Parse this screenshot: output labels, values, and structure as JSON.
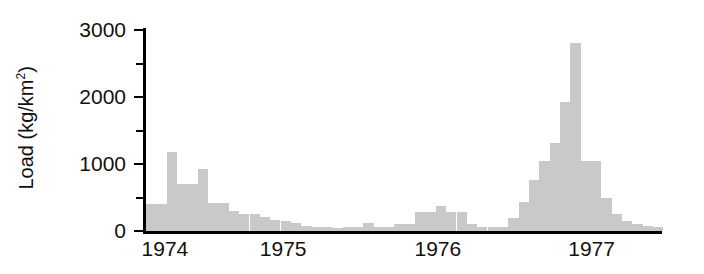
{
  "chart_data": {
    "type": "bar",
    "title": "",
    "subtitle": "",
    "xlabel": "",
    "ylabel": "Load (kg/km2)",
    "ylabel_plain": "Load  (kg/km",
    "ylabel_sup": "2",
    "ylabel_close": ")",
    "ylim": [
      0,
      3000
    ],
    "xlim_labels": [
      "1974",
      "1975",
      "1976",
      "1977"
    ],
    "ytick_labels": [
      "0",
      "1000",
      "2000",
      "3000"
    ],
    "ytick_values": [
      0,
      1000,
      2000,
      3000
    ],
    "yminor_values": [
      500,
      1500,
      2500
    ],
    "grid": false,
    "legend": false,
    "bar_color": "#c9c9c9",
    "axis_color": "#000000",
    "x": [
      "1974.00",
      "1974.04",
      "1974.08",
      "1974.12",
      "1974.17",
      "1974.21",
      "1974.25",
      "1974.29",
      "1974.33",
      "1974.38",
      "1974.42",
      "1974.46",
      "1974.50",
      "1974.54",
      "1974.58",
      "1974.62",
      "1974.67",
      "1974.71",
      "1974.75",
      "1974.79",
      "1974.83",
      "1974.88",
      "1974.92",
      "1974.96",
      "1975.00",
      "1975.04",
      "1975.08",
      "1975.12",
      "1975.17",
      "1975.21",
      "1975.25",
      "1975.29",
      "1975.33",
      "1975.38",
      "1975.42",
      "1975.46",
      "1975.50",
      "1975.54",
      "1975.58",
      "1975.62",
      "1975.67",
      "1975.71",
      "1975.75"
    ],
    "values": [
      400,
      400,
      1180,
      1180,
      700,
      700,
      930,
      930,
      420,
      420,
      300,
      250,
      250,
      215,
      190,
      160,
      150,
      120,
      75,
      70,
      60,
      55,
      50,
      55,
      60,
      120,
      120,
      300,
      300,
      370,
      370,
      300,
      300,
      90,
      60,
      60,
      80,
      200,
      430,
      760,
      1040,
      1310,
      1930
    ],
    "bars": [
      {
        "x": 0,
        "v": 400
      },
      {
        "x": 1,
        "v": 400
      },
      {
        "x": 2,
        "v": 1180
      },
      {
        "x": 3,
        "v": 700
      },
      {
        "x": 4,
        "v": 700
      },
      {
        "x": 5,
        "v": 930
      },
      {
        "x": 6,
        "v": 420
      },
      {
        "x": 7,
        "v": 420
      },
      {
        "x": 8,
        "v": 300
      },
      {
        "x": 9,
        "v": 250
      },
      {
        "x": 10,
        "v": 250
      },
      {
        "x": 11,
        "v": 215
      },
      {
        "x": 12,
        "v": 165
      },
      {
        "x": 13,
        "v": 150
      },
      {
        "x": 14,
        "v": 120
      },
      {
        "x": 15,
        "v": 75
      },
      {
        "x": 16,
        "v": 60
      },
      {
        "x": 17,
        "v": 55
      },
      {
        "x": 18,
        "v": 50
      },
      {
        "x": 19,
        "v": 55
      },
      {
        "x": 20,
        "v": 60
      },
      {
        "x": 21,
        "v": 120
      },
      {
        "x": 22,
        "v": 60
      },
      {
        "x": 23,
        "v": 55
      },
      {
        "x": 24,
        "v": 110
      },
      {
        "x": 25,
        "v": 110
      },
      {
        "x": 26,
        "v": 290
      },
      {
        "x": 27,
        "v": 290
      },
      {
        "x": 28,
        "v": 370
      },
      {
        "x": 29,
        "v": 290
      },
      {
        "x": 30,
        "v": 290
      },
      {
        "x": 31,
        "v": 100
      },
      {
        "x": 32,
        "v": 60
      },
      {
        "x": 33,
        "v": 55
      },
      {
        "x": 34,
        "v": 60
      },
      {
        "x": 35,
        "v": 200
      },
      {
        "x": 36,
        "v": 430
      },
      {
        "x": 37,
        "v": 760
      },
      {
        "x": 38,
        "v": 1040
      },
      {
        "x": 39,
        "v": 1310
      },
      {
        "x": 40,
        "v": 1930
      },
      {
        "x": 41,
        "v": 2800
      },
      {
        "x": 42,
        "v": 1040
      },
      {
        "x": 43,
        "v": 1040
      },
      {
        "x": 44,
        "v": 490
      },
      {
        "x": 45,
        "v": 250
      },
      {
        "x": 46,
        "v": 150
      },
      {
        "x": 47,
        "v": 110
      },
      {
        "x": 48,
        "v": 80
      },
      {
        "x": 49,
        "v": 60
      }
    ],
    "annotations": []
  },
  "axes": {
    "y_title_prefix": "Load  (kg/km",
    "y_title_superscript": "2",
    "y_title_suffix": ")",
    "y_ticks": [
      {
        "label": "3000",
        "value": 3000,
        "major": true
      },
      {
        "label": "",
        "value": 2500,
        "major": false
      },
      {
        "label": "2000",
        "value": 2000,
        "major": true
      },
      {
        "label": "",
        "value": 1500,
        "major": false
      },
      {
        "label": "1000",
        "value": 1000,
        "major": true
      },
      {
        "label": "",
        "value": 500,
        "major": false
      },
      {
        "label": "0",
        "value": 0,
        "major": true
      }
    ],
    "x_ticks": [
      {
        "label": "1974",
        "pos": 0.042
      },
      {
        "label": "1975",
        "pos": 0.272
      },
      {
        "label": "1976",
        "pos": 0.573
      },
      {
        "label": "1977",
        "pos": 0.872
      }
    ]
  }
}
